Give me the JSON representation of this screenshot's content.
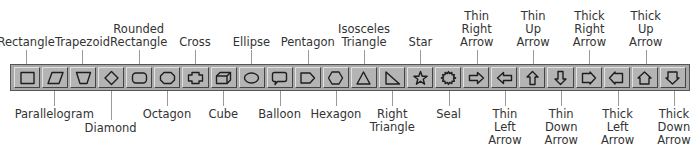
{
  "toolbar": {
    "name": "AutoShapes toolbar",
    "buttons": [
      {
        "id": "rectangle",
        "label": "Rectangle",
        "pos": "top",
        "lines": [
          "Rectangle"
        ]
      },
      {
        "id": "parallelogram",
        "label": "Parallelogram",
        "pos": "bottom",
        "lines": [
          "Parallelogram"
        ]
      },
      {
        "id": "trapezoid",
        "label": "Trapezoid",
        "pos": "top",
        "lines": [
          "Trapezoid"
        ]
      },
      {
        "id": "diamond",
        "label": "Diamond",
        "pos": "bottom",
        "lines": [
          "Diamond"
        ]
      },
      {
        "id": "rounded-rectangle",
        "label": "Rounded Rectangle",
        "pos": "top",
        "lines": [
          "Rounded",
          "Rectangle"
        ]
      },
      {
        "id": "octagon",
        "label": "Octagon",
        "pos": "bottom",
        "lines": [
          "Octagon"
        ]
      },
      {
        "id": "cross",
        "label": "Cross",
        "pos": "top",
        "lines": [
          "Cross"
        ]
      },
      {
        "id": "cube",
        "label": "Cube",
        "pos": "bottom",
        "lines": [
          "Cube"
        ]
      },
      {
        "id": "ellipse",
        "label": "Ellipse",
        "pos": "top",
        "lines": [
          "Ellipse"
        ]
      },
      {
        "id": "balloon",
        "label": "Balloon",
        "pos": "bottom",
        "lines": [
          "Balloon"
        ]
      },
      {
        "id": "pentagon",
        "label": "Pentagon",
        "pos": "top",
        "lines": [
          "Pentagon"
        ]
      },
      {
        "id": "hexagon",
        "label": "Hexagon",
        "pos": "bottom",
        "lines": [
          "Hexagon"
        ]
      },
      {
        "id": "isosceles-triangle",
        "label": "Isosceles Triangle",
        "pos": "top",
        "lines": [
          "Isosceles",
          "Triangle"
        ]
      },
      {
        "id": "right-triangle",
        "label": "Right Triangle",
        "pos": "bottom",
        "lines": [
          "Right",
          "Triangle"
        ]
      },
      {
        "id": "star",
        "label": "Star",
        "pos": "top",
        "lines": [
          "Star"
        ]
      },
      {
        "id": "seal",
        "label": "Seal",
        "pos": "bottom",
        "lines": [
          "Seal"
        ]
      },
      {
        "id": "thin-right-arrow",
        "label": "Thin Right Arrow",
        "pos": "top",
        "lines": [
          "Thin",
          "Right",
          "Arrow"
        ]
      },
      {
        "id": "thin-left-arrow",
        "label": "Thin Left Arrow",
        "pos": "bottom",
        "lines": [
          "Thin",
          "Left",
          "Arrow"
        ]
      },
      {
        "id": "thin-up-arrow",
        "label": "Thin Up Arrow",
        "pos": "top",
        "lines": [
          "Thin",
          "Up",
          "Arrow"
        ]
      },
      {
        "id": "thin-down-arrow",
        "label": "Thin Down Arrow",
        "pos": "bottom",
        "lines": [
          "Thin",
          "Down",
          "Arrow"
        ]
      },
      {
        "id": "thick-right-arrow",
        "label": "Thick Right Arrow",
        "pos": "top",
        "lines": [
          "Thick",
          "Right",
          "Arrow"
        ]
      },
      {
        "id": "thick-left-arrow",
        "label": "Thick Left Arrow",
        "pos": "bottom",
        "lines": [
          "Thick",
          "Left",
          "Arrow"
        ]
      },
      {
        "id": "thick-up-arrow",
        "label": "Thick Up Arrow",
        "pos": "top",
        "lines": [
          "Thick",
          "Up",
          "Arrow"
        ]
      },
      {
        "id": "thick-down-arrow",
        "label": "Thick Down Arrow",
        "pos": "bottom",
        "lines": [
          "Thick",
          "Down",
          "Arrow"
        ]
      }
    ]
  },
  "colors": {
    "toolbar_bg": "#a9a9a9",
    "button_bg": "#b4b4b4",
    "icon_stroke": "#1e1e1e",
    "label_text": "#333333",
    "leader_line": "#9a9a9a"
  }
}
